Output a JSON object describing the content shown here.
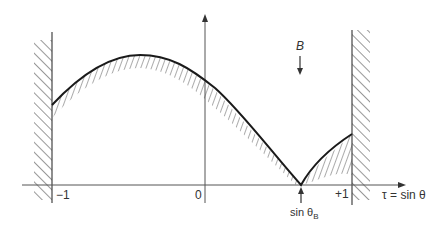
{
  "diagram": {
    "x_axis": {
      "label": "τ = sin θ",
      "ticks": [
        "−1",
        "0",
        "+1"
      ]
    },
    "marker": {
      "label_main": "sin θ",
      "label_sub": "B"
    },
    "field_label": "B",
    "colors": {
      "line": "#1a1a1a",
      "hatch": "#333333",
      "axis": "#555555"
    }
  }
}
